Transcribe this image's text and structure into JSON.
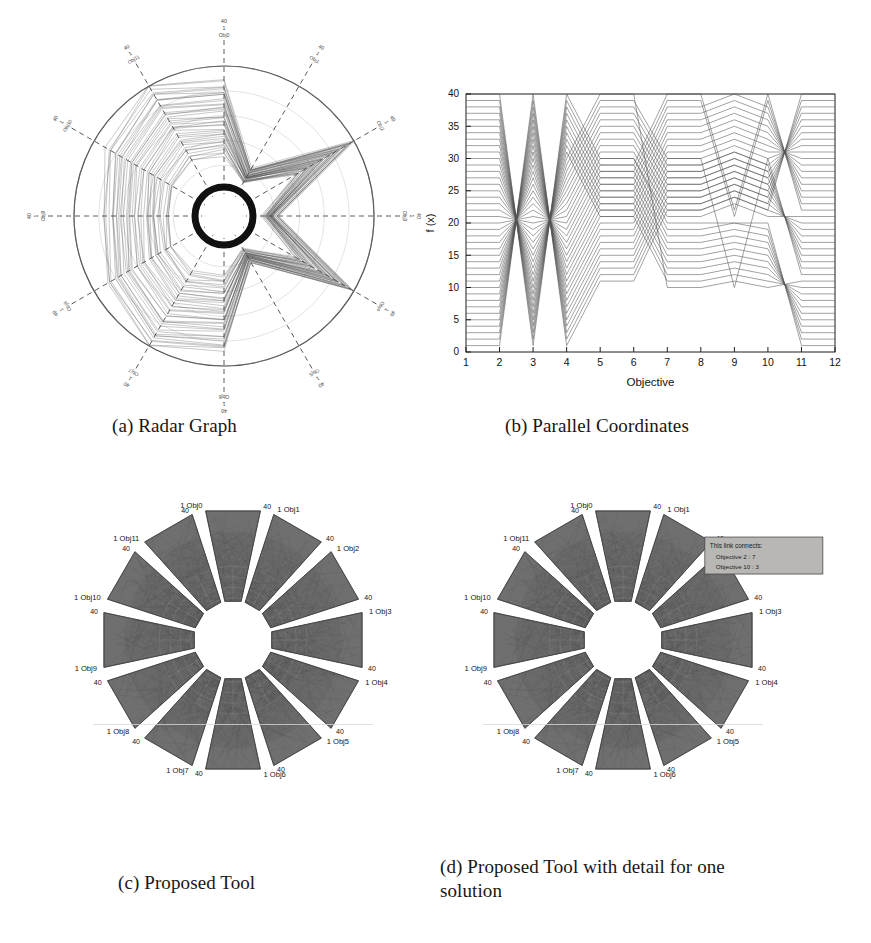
{
  "figure": {
    "subfigures": [
      {
        "key": "a",
        "caption": "(a) Radar Graph"
      },
      {
        "key": "b",
        "caption": "(b) Parallel Coordinates"
      },
      {
        "key": "c",
        "caption": "(c) Proposed Tool"
      },
      {
        "key": "d",
        "caption": "(d) Proposed Tool with detail for one\nsolution"
      }
    ]
  },
  "radar": {
    "num_axes": 12,
    "axis_min_label": "1",
    "axis_max_label": "40",
    "axis_labels": [
      "Obj0",
      "Obj1",
      "Obj2",
      "Obj3",
      "Obj4",
      "Obj5",
      "Obj6",
      "Obj7",
      "Obj8",
      "Obj9",
      "Obj10",
      "Obj11"
    ],
    "ring_count": 5,
    "series_count": 40,
    "line_color": "#4b4b4b",
    "hub_color": "#111111"
  },
  "parallel": {
    "xlabel": "Objective",
    "ylabel": "f (x)",
    "xticks": [
      "1",
      "2",
      "3",
      "4",
      "5",
      "6",
      "7",
      "8",
      "9",
      "10",
      "11",
      "12"
    ],
    "yticks": [
      "0",
      "5",
      "10",
      "15",
      "20",
      "25",
      "30",
      "35",
      "40"
    ],
    "line_color": "#555555"
  },
  "tool": {
    "petal_count": 12,
    "inner_label": "1",
    "outer_label": "40",
    "objective_names": [
      "Obj0",
      "Obj1",
      "Obj2",
      "Obj3",
      "Obj4",
      "Obj5",
      "Obj6",
      "Obj7",
      "Obj8",
      "Obj9",
      "Obj10",
      "Obj11"
    ],
    "fill_color": "#6f6f6f",
    "edge_color": "#3a3a3a",
    "label_color": "#141414"
  },
  "tooltip": {
    "title": "This link connects:",
    "line1": "Objective 2 : 7",
    "line2": "Objective 10 : 3",
    "bg_color": "#b9b7b4",
    "border_color": "#4a4a4a"
  },
  "chart_data": [
    {
      "type": "radar",
      "title": "(a) Radar Graph",
      "axes": [
        "Obj0",
        "Obj1",
        "Obj2",
        "Obj3",
        "Obj4",
        "Obj5",
        "Obj6",
        "Obj7",
        "Obj8",
        "Obj9",
        "Obj10",
        "Obj11"
      ],
      "range": [
        1,
        40
      ],
      "rlim": [
        1,
        40
      ],
      "grid": true,
      "legend": "none",
      "series_count": 40,
      "note": "40 overlapping solution polygons drawn over a 12-axis star plot; dashed radial axes, circular outer boundary, dark hub at the centre."
    },
    {
      "type": "line",
      "title": "(b) Parallel Coordinates",
      "xlabel": "Objective",
      "ylabel": "f (x)",
      "x": [
        1,
        2,
        3,
        4,
        5,
        6,
        7,
        8,
        9,
        10,
        11,
        12
      ],
      "xlim": [
        1,
        12
      ],
      "ylim": [
        0,
        40
      ],
      "yticks": [
        0,
        5,
        10,
        15,
        20,
        25,
        30,
        35,
        40
      ],
      "grid": false,
      "legend": "none",
      "series": [
        {
          "name": "s1",
          "values": [
            40,
            40,
            1,
            40,
            30,
            30,
            20,
            20,
            20,
            20,
            1,
            1
          ]
        },
        {
          "name": "s2",
          "values": [
            39,
            39,
            2,
            39,
            29,
            29,
            19,
            19,
            20,
            19,
            2,
            2
          ]
        },
        {
          "name": "s3",
          "values": [
            38,
            38,
            3,
            38,
            28,
            28,
            18,
            18,
            19,
            18,
            3,
            3
          ]
        },
        {
          "name": "s4",
          "values": [
            37,
            37,
            4,
            37,
            27,
            27,
            17,
            17,
            18,
            17,
            4,
            4
          ]
        },
        {
          "name": "s5",
          "values": [
            36,
            36,
            5,
            36,
            26,
            26,
            16,
            16,
            17,
            16,
            5,
            5
          ]
        },
        {
          "name": "s6",
          "values": [
            35,
            35,
            6,
            35,
            25,
            25,
            15,
            15,
            16,
            15,
            6,
            6
          ]
        },
        {
          "name": "s7",
          "values": [
            34,
            34,
            7,
            34,
            24,
            24,
            14,
            14,
            15,
            14,
            7,
            7
          ]
        },
        {
          "name": "s8",
          "values": [
            33,
            33,
            8,
            33,
            23,
            23,
            13,
            13,
            14,
            13,
            8,
            8
          ]
        },
        {
          "name": "s9",
          "values": [
            32,
            32,
            9,
            32,
            22,
            22,
            12,
            12,
            13,
            12,
            9,
            9
          ]
        },
        {
          "name": "s10",
          "values": [
            31,
            31,
            10,
            31,
            21,
            21,
            11,
            11,
            12,
            11,
            10,
            10
          ]
        },
        {
          "name": "s11",
          "values": [
            30,
            30,
            11,
            30,
            40,
            40,
            10,
            10,
            11,
            10,
            11,
            11
          ]
        },
        {
          "name": "s12",
          "values": [
            29,
            29,
            12,
            29,
            39,
            39,
            30,
            30,
            10,
            30,
            12,
            12
          ]
        },
        {
          "name": "s13",
          "values": [
            28,
            28,
            13,
            28,
            38,
            38,
            29,
            29,
            31,
            29,
            13,
            13
          ]
        },
        {
          "name": "s14",
          "values": [
            27,
            27,
            14,
            27,
            37,
            37,
            28,
            28,
            30,
            28,
            14,
            14
          ]
        },
        {
          "name": "s15",
          "values": [
            26,
            26,
            15,
            26,
            36,
            36,
            27,
            27,
            29,
            27,
            15,
            15
          ]
        },
        {
          "name": "s16",
          "values": [
            25,
            25,
            16,
            25,
            35,
            35,
            26,
            26,
            28,
            26,
            16,
            16
          ]
        },
        {
          "name": "s17",
          "values": [
            24,
            24,
            17,
            24,
            34,
            34,
            25,
            25,
            27,
            25,
            17,
            17
          ]
        },
        {
          "name": "s18",
          "values": [
            23,
            23,
            18,
            23,
            33,
            33,
            24,
            24,
            26,
            24,
            18,
            18
          ]
        },
        {
          "name": "s19",
          "values": [
            22,
            22,
            19,
            22,
            32,
            32,
            23,
            23,
            25,
            23,
            19,
            19
          ]
        },
        {
          "name": "s20",
          "values": [
            21,
            21,
            20,
            21,
            31,
            31,
            22,
            22,
            24,
            22,
            20,
            20
          ]
        },
        {
          "name": "s21",
          "values": [
            20,
            20,
            21,
            20,
            30,
            30,
            21,
            21,
            23,
            21,
            21,
            21
          ]
        },
        {
          "name": "s22",
          "values": [
            19,
            19,
            22,
            19,
            29,
            29,
            40,
            40,
            22,
            40,
            22,
            22
          ]
        },
        {
          "name": "s23",
          "values": [
            18,
            18,
            23,
            18,
            28,
            28,
            39,
            39,
            21,
            39,
            23,
            23
          ]
        },
        {
          "name": "s24",
          "values": [
            17,
            17,
            24,
            17,
            27,
            27,
            38,
            38,
            40,
            38,
            24,
            24
          ]
        },
        {
          "name": "s25",
          "values": [
            16,
            16,
            25,
            16,
            26,
            26,
            37,
            37,
            39,
            37,
            25,
            25
          ]
        },
        {
          "name": "s26",
          "values": [
            15,
            15,
            26,
            15,
            25,
            25,
            36,
            36,
            38,
            36,
            26,
            26
          ]
        },
        {
          "name": "s27",
          "values": [
            14,
            14,
            27,
            14,
            24,
            24,
            35,
            35,
            37,
            35,
            27,
            27
          ]
        },
        {
          "name": "s28",
          "values": [
            13,
            13,
            28,
            13,
            23,
            23,
            34,
            34,
            36,
            34,
            28,
            28
          ]
        },
        {
          "name": "s29",
          "values": [
            12,
            12,
            29,
            12,
            22,
            22,
            33,
            33,
            35,
            33,
            29,
            29
          ]
        },
        {
          "name": "s30",
          "values": [
            11,
            11,
            30,
            11,
            21,
            21,
            32,
            32,
            34,
            32,
            30,
            30
          ]
        },
        {
          "name": "s31",
          "values": [
            10,
            10,
            31,
            10,
            20,
            20,
            31,
            31,
            33,
            31,
            31,
            31
          ]
        },
        {
          "name": "s32",
          "values": [
            9,
            9,
            32,
            9,
            19,
            19,
            30,
            30,
            32,
            30,
            32,
            32
          ]
        },
        {
          "name": "s33",
          "values": [
            8,
            8,
            33,
            8,
            18,
            18,
            29,
            29,
            31,
            29,
            33,
            33
          ]
        },
        {
          "name": "s34",
          "values": [
            7,
            7,
            34,
            7,
            17,
            17,
            28,
            28,
            30,
            28,
            34,
            34
          ]
        },
        {
          "name": "s35",
          "values": [
            6,
            6,
            35,
            6,
            16,
            16,
            27,
            27,
            29,
            27,
            35,
            35
          ]
        },
        {
          "name": "s36",
          "values": [
            5,
            5,
            36,
            5,
            15,
            15,
            26,
            26,
            28,
            26,
            36,
            36
          ]
        },
        {
          "name": "s37",
          "values": [
            4,
            4,
            37,
            4,
            14,
            14,
            25,
            25,
            27,
            25,
            37,
            37
          ]
        },
        {
          "name": "s38",
          "values": [
            3,
            3,
            38,
            3,
            13,
            13,
            24,
            24,
            26,
            24,
            38,
            38
          ]
        },
        {
          "name": "s39",
          "values": [
            2,
            2,
            39,
            2,
            12,
            12,
            23,
            23,
            25,
            23,
            39,
            39
          ]
        },
        {
          "name": "s40",
          "values": [
            1,
            1,
            40,
            1,
            11,
            11,
            22,
            22,
            24,
            22,
            40,
            40
          ]
        }
      ]
    },
    {
      "type": "radar",
      "title": "(c) Proposed Tool",
      "axes": [
        "Obj0",
        "Obj1",
        "Obj2",
        "Obj3",
        "Obj4",
        "Obj5",
        "Obj6",
        "Obj7",
        "Obj8",
        "Obj9",
        "Obj10",
        "Obj11"
      ],
      "range": [
        1,
        40
      ],
      "rlim": [
        1,
        40
      ],
      "grid": true,
      "legend": "none",
      "series_count": 40,
      "note": "Twelve fan-shaped objective sectors arranged radially; each sector is annotated with 1 at its inner edge and 40 at its outer edge; dense grey solution links fill the disc."
    },
    {
      "type": "radar",
      "title": "(d) Proposed Tool with detail for one solution",
      "axes": [
        "Obj0",
        "Obj1",
        "Obj2",
        "Obj3",
        "Obj4",
        "Obj5",
        "Obj6",
        "Obj7",
        "Obj8",
        "Obj9",
        "Obj10",
        "Obj11"
      ],
      "range": [
        1,
        40
      ],
      "rlim": [
        1,
        40
      ],
      "grid": true,
      "legend": "none",
      "series_count": 40,
      "annotation": {
        "title": "This link connects:",
        "rows": [
          "Objective 2 : 7",
          "Objective 10 : 3"
        ]
      },
      "note": "Same twelve-sector layout as (c) with a highlighted single solution and a grey tooltip box near the Obj1 sector."
    }
  ]
}
